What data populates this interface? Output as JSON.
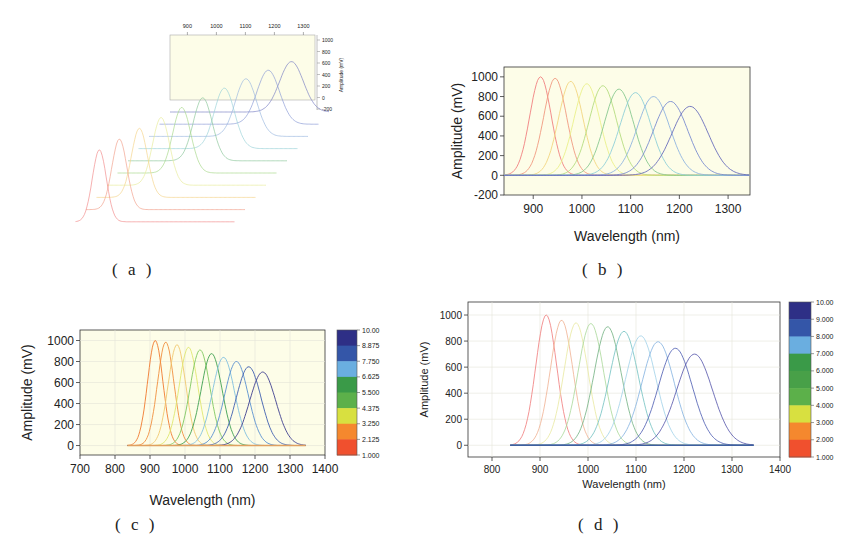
{
  "chart_data": [
    {
      "id": "a",
      "type": "line",
      "style": "waterfall-3d",
      "title": "",
      "caption": "( a )",
      "xlabel": "",
      "ylabel": "Amplitude (mV)",
      "x_ticks": [
        "900",
        "1000",
        "1100",
        "1200",
        "1300"
      ],
      "y_ticks": [
        "1000",
        "800",
        "600",
        "400",
        "200",
        "0",
        "-200"
      ],
      "xlim": [
        840,
        1340
      ],
      "ylim": [
        -200,
        1000
      ],
      "grid": false,
      "background": "#fdfde8",
      "series": [
        {
          "name": "1",
          "peak_nm": 915,
          "peak_mV": 1000,
          "color": "#f28b8b"
        },
        {
          "name": "2",
          "peak_nm": 945,
          "peak_mV": 980,
          "color": "#f2a08b"
        },
        {
          "name": "3",
          "peak_nm": 975,
          "peak_mV": 960,
          "color": "#f5d48a"
        },
        {
          "name": "4",
          "peak_nm": 1010,
          "peak_mV": 940,
          "color": "#e8ec9a"
        },
        {
          "name": "5",
          "peak_nm": 1042,
          "peak_mV": 910,
          "color": "#a8d88a"
        },
        {
          "name": "6",
          "peak_nm": 1075,
          "peak_mV": 875,
          "color": "#8cc79a"
        },
        {
          "name": "7",
          "peak_nm": 1110,
          "peak_mV": 840,
          "color": "#9ad2d8"
        },
        {
          "name": "8",
          "peak_nm": 1145,
          "peak_mV": 800,
          "color": "#9ab8e0"
        },
        {
          "name": "9",
          "peak_nm": 1182,
          "peak_mV": 750,
          "color": "#8a9ad6"
        },
        {
          "name": "10",
          "peak_nm": 1222,
          "peak_mV": 700,
          "color": "#7a80c4"
        }
      ]
    },
    {
      "id": "b",
      "type": "line",
      "title": "",
      "caption": "( b )",
      "xlabel": "Wavelength (nm)",
      "ylabel": "Amplitude (mV)",
      "x_ticks": [
        "900",
        "1000",
        "1100",
        "1200",
        "1300"
      ],
      "y_ticks": [
        "1000",
        "800",
        "600",
        "400",
        "200",
        "0",
        "-200"
      ],
      "xlim": [
        840,
        1345
      ],
      "ylim": [
        -200,
        1100
      ],
      "grid": false,
      "background": "#fdfde8",
      "series": [
        {
          "name": "1",
          "peak_nm": 915,
          "peak_mV": 1000,
          "color": "#f08080"
        },
        {
          "name": "2",
          "peak_nm": 945,
          "peak_mV": 985,
          "color": "#f09a80"
        },
        {
          "name": "3",
          "peak_nm": 977,
          "peak_mV": 955,
          "color": "#f3d680"
        },
        {
          "name": "4",
          "peak_nm": 1010,
          "peak_mV": 930,
          "color": "#eaf08a"
        },
        {
          "name": "5",
          "peak_nm": 1043,
          "peak_mV": 910,
          "color": "#b5dc80"
        },
        {
          "name": "6",
          "peak_nm": 1076,
          "peak_mV": 875,
          "color": "#88c890"
        },
        {
          "name": "7",
          "peak_nm": 1110,
          "peak_mV": 840,
          "color": "#90d0d8"
        },
        {
          "name": "8",
          "peak_nm": 1147,
          "peak_mV": 800,
          "color": "#90b4e0"
        },
        {
          "name": "9",
          "peak_nm": 1182,
          "peak_mV": 750,
          "color": "#7a8cd0"
        },
        {
          "name": "10",
          "peak_nm": 1222,
          "peak_mV": 700,
          "color": "#6a6ebc"
        }
      ]
    },
    {
      "id": "c",
      "type": "line",
      "title": "",
      "caption": "( c )",
      "xlabel": "Wavelength (nm)",
      "ylabel": "Amplitude (mV)",
      "x_ticks": [
        "700",
        "800",
        "900",
        "1000",
        "1100",
        "1200",
        "1300",
        "1400"
      ],
      "y_ticks": [
        "1000",
        "800",
        "600",
        "400",
        "200",
        "0"
      ],
      "xlim": [
        700,
        1400
      ],
      "ylim": [
        -90,
        1100
      ],
      "grid": true,
      "background": "#fdfde8",
      "colorbar": {
        "ticks": [
          "10.00",
          "8.875",
          "7.750",
          "6.625",
          "5.500",
          "4.375",
          "3.250",
          "2.125",
          "1.000"
        ],
        "colors": [
          "#2e2f86",
          "#3456a8",
          "#6aaee0",
          "#3a9a48",
          "#5cb04a",
          "#d8e040",
          "#f5882e",
          "#f0502e"
        ]
      },
      "series": [
        {
          "name": "1",
          "peak_nm": 915,
          "peak_mV": 1000,
          "color": "#f07a30"
        },
        {
          "name": "2",
          "peak_nm": 945,
          "peak_mV": 985,
          "color": "#f09040"
        },
        {
          "name": "3",
          "peak_nm": 977,
          "peak_mV": 960,
          "color": "#f0c870"
        },
        {
          "name": "4",
          "peak_nm": 1010,
          "peak_mV": 935,
          "color": "#e0e870"
        },
        {
          "name": "5",
          "peak_nm": 1043,
          "peak_mV": 910,
          "color": "#80c860"
        },
        {
          "name": "6",
          "peak_nm": 1076,
          "peak_mV": 875,
          "color": "#40a050"
        },
        {
          "name": "7",
          "peak_nm": 1110,
          "peak_mV": 840,
          "color": "#80c0e0"
        },
        {
          "name": "8",
          "peak_nm": 1147,
          "peak_mV": 800,
          "color": "#5890d0"
        },
        {
          "name": "9",
          "peak_nm": 1182,
          "peak_mV": 750,
          "color": "#4060b0"
        },
        {
          "name": "10",
          "peak_nm": 1222,
          "peak_mV": 700,
          "color": "#404090"
        }
      ]
    },
    {
      "id": "d",
      "type": "line",
      "title": "",
      "caption": "( d )",
      "xlabel": "Wavelength (nm)",
      "ylabel": "Amplitude (mV)",
      "x_ticks": [
        "800",
        "900",
        "1000",
        "1100",
        "1200",
        "1300",
        "1400"
      ],
      "y_ticks": [
        "1000",
        "800",
        "600",
        "400",
        "200",
        "0"
      ],
      "xlim": [
        750,
        1400
      ],
      "ylim": [
        -90,
        1100
      ],
      "grid": true,
      "background": "#ffffff",
      "colorbar": {
        "ticks": [
          "10.00",
          "9.000",
          "8.000",
          "7.000",
          "6.000",
          "5.000",
          "4.000",
          "3.000",
          "2.000",
          "1.000"
        ],
        "colors": [
          "#2e2f86",
          "#3456a8",
          "#6aaee0",
          "#3a9a48",
          "#48a048",
          "#5cb04a",
          "#d8e040",
          "#f5882e",
          "#f0502e"
        ]
      },
      "series": [
        {
          "name": "1",
          "peak_nm": 913,
          "peak_mV": 1000,
          "color": "#f07878"
        },
        {
          "name": "2",
          "peak_nm": 945,
          "peak_mV": 960,
          "color": "#f0b090"
        },
        {
          "name": "3",
          "peak_nm": 975,
          "peak_mV": 940,
          "color": "#e8e8a0"
        },
        {
          "name": "4",
          "peak_nm": 1006,
          "peak_mV": 935,
          "color": "#a8d898"
        },
        {
          "name": "5",
          "peak_nm": 1041,
          "peak_mV": 910,
          "color": "#70b080"
        },
        {
          "name": "6",
          "peak_nm": 1075,
          "peak_mV": 875,
          "color": "#70c0c0"
        },
        {
          "name": "7",
          "peak_nm": 1110,
          "peak_mV": 840,
          "color": "#a0d0e8"
        },
        {
          "name": "8",
          "peak_nm": 1146,
          "peak_mV": 795,
          "color": "#80b0e0"
        },
        {
          "name": "9",
          "peak_nm": 1182,
          "peak_mV": 745,
          "color": "#4858b0"
        },
        {
          "name": "10",
          "peak_nm": 1222,
          "peak_mV": 700,
          "color": "#5050a8"
        }
      ]
    }
  ],
  "captions": {
    "a": "( a )",
    "b": "( b )",
    "c": "( c )",
    "d": "( d )"
  },
  "axis_titles": {
    "amplitude": "Amplitude (mV)",
    "wavelength": "Wavelength (nm)"
  }
}
